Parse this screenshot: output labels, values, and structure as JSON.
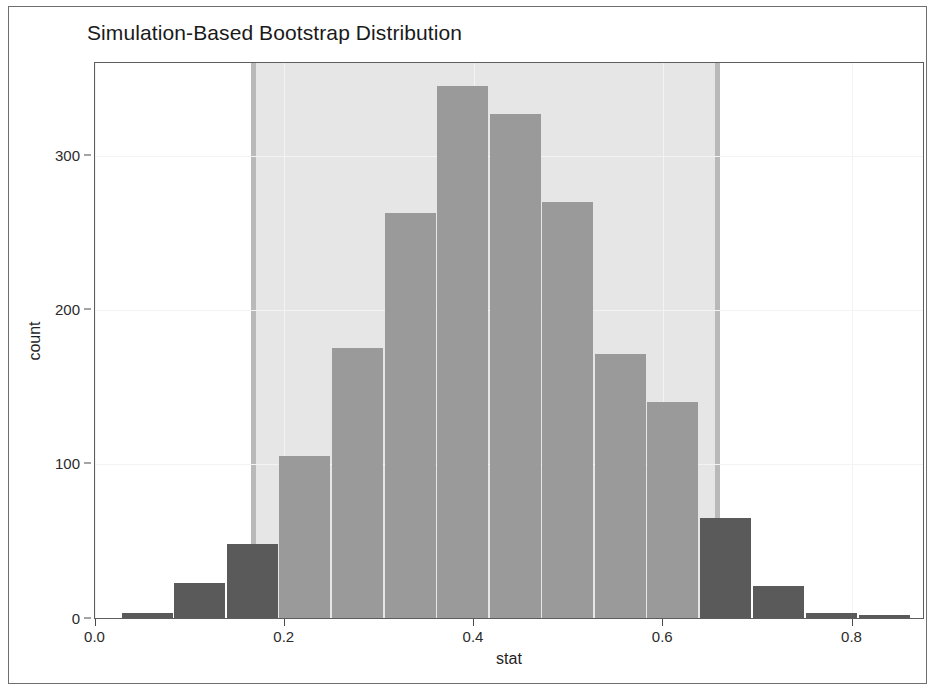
{
  "chart_data": {
    "type": "bar",
    "title": "Simulation-Based Bootstrap Distribution",
    "xlabel": "stat",
    "ylabel": "count",
    "xlim": [
      0.0,
      0.875
    ],
    "ylim": [
      0,
      360
    ],
    "xticks": [
      "0.0",
      "0.2",
      "0.4",
      "0.6",
      "0.8"
    ],
    "xtick_values": [
      0.0,
      0.2,
      0.4,
      0.6,
      0.8
    ],
    "yticks": [
      "0",
      "100",
      "200",
      "300"
    ],
    "ytick_values": [
      0,
      100,
      200,
      300
    ],
    "grid": true,
    "legend": "none",
    "bin_width": 0.0556,
    "categories": [
      "0.028-0.083",
      "0.083-0.139",
      "0.139-0.194",
      "0.194-0.250",
      "0.250-0.306",
      "0.306-0.361",
      "0.361-0.417",
      "0.417-0.472",
      "0.472-0.528",
      "0.528-0.583",
      "0.583-0.639",
      "0.639-0.694",
      "0.694-0.750",
      "0.750-0.806",
      "0.806-0.861"
    ],
    "bin_starts": [
      0.028,
      0.083,
      0.139,
      0.194,
      0.25,
      0.306,
      0.361,
      0.417,
      0.472,
      0.528,
      0.583,
      0.639,
      0.694,
      0.75,
      0.806
    ],
    "values": [
      3,
      23,
      48,
      105,
      175,
      263,
      345,
      327,
      270,
      171,
      140,
      65,
      21,
      3,
      2
    ],
    "bar_fill_inside_ci": "#9a9a9a",
    "bar_fill_outside_ci": "#5a5a5a",
    "confidence_interval": {
      "lower": 0.168,
      "upper": 0.6,
      "band_color": "#e6e6e6",
      "edge_color": "#b9b9b9",
      "shaded_from": 0.1675,
      "shaded_to": 0.6575
    },
    "annotations": []
  }
}
